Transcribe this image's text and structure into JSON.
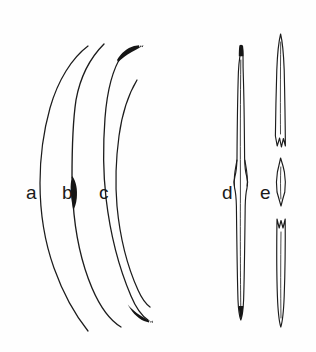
{
  "figure": {
    "background_color": "#fefefe",
    "ink_color": "#1c1c1c",
    "width": 316,
    "height": 352,
    "style": "scientific line drawing plate"
  },
  "labels": {
    "a": "a",
    "b": "b",
    "c": "c",
    "d": "d",
    "e": "e"
  },
  "specimens": [
    {
      "id": "a",
      "label": "a",
      "label_x": 26,
      "label_y": 199,
      "form": "slender open arc, thin uniform line, tapering to fine points at both ends",
      "tips": "none darkened",
      "span_y": [
        46,
        331
      ]
    },
    {
      "id": "b",
      "label": "b",
      "label_x": 62,
      "label_y": 199,
      "form": "curved arc with dark lens-shaped thickening at mid-length",
      "tips": "none darkened",
      "thickening_y": 190,
      "span_y": [
        44,
        327
      ]
    },
    {
      "id": "c",
      "label": "c",
      "label_x": 99,
      "label_y": 199,
      "form": "strongly curved arc with heavy blackened club-like tips at both extremities",
      "tips": "both ends darkened and thickened",
      "span_y": [
        47,
        322
      ]
    },
    {
      "id": "d",
      "label": "d",
      "label_x": 228,
      "label_y": 199,
      "form": "elongate straight spindle, outlined, with constricted waist near mid-length and dark apical tip",
      "tips": "upper tip darkened, lower tip darkened",
      "span_y": [
        45,
        320
      ]
    },
    {
      "id": "e",
      "label": "e",
      "label_x": 265,
      "label_y": 199,
      "form": "elongate spindle broken into three fragments with notched fracture ends",
      "fragments": 3,
      "tips": "pointed, unfilled outline",
      "span_y": [
        33,
        327
      ]
    }
  ]
}
